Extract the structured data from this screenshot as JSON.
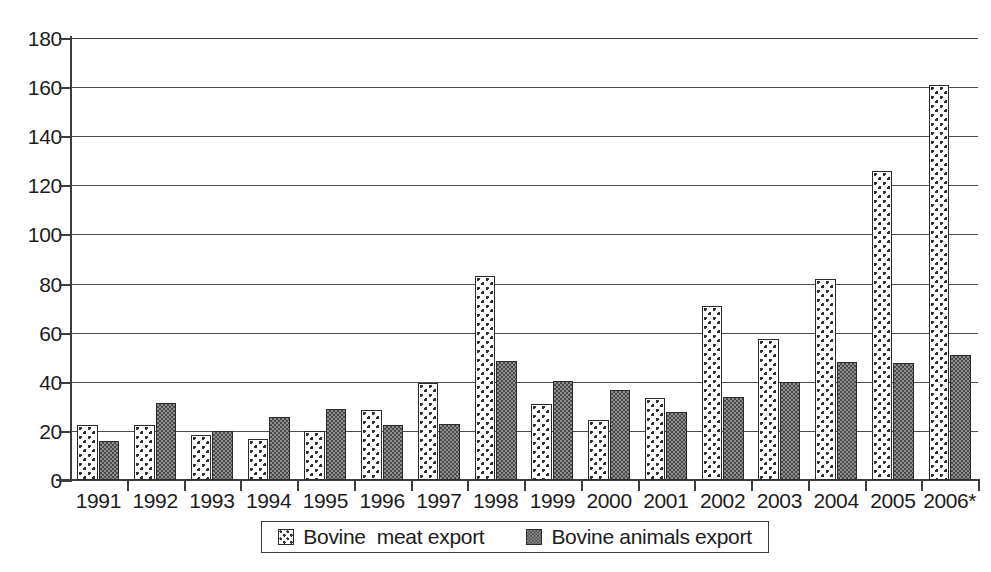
{
  "chart_data": {
    "type": "bar",
    "title": "",
    "subtitle": "",
    "xlabel": "",
    "ylabel": "",
    "categories": [
      "1991",
      "1992",
      "1993",
      "1994",
      "1995",
      "1996",
      "1997",
      "1998",
      "1999",
      "2000",
      "2001",
      "2002",
      "2003",
      "2004",
      "2005",
      "2006*"
    ],
    "series": [
      {
        "name": "Bovine  meat export",
        "values": [
          22.5,
          22.5,
          18.5,
          16.5,
          20,
          28.5,
          39.5,
          83,
          31,
          24.5,
          33.5,
          71,
          57.5,
          82,
          126,
          161
        ]
      },
      {
        "name": "Bovine animals export",
        "values": [
          16,
          31.5,
          20,
          25.5,
          29,
          22.5,
          23,
          48.5,
          40.5,
          36.5,
          27.5,
          34,
          40,
          48,
          47.5,
          51
        ]
      }
    ],
    "ylim": [
      0,
      180
    ],
    "y_ticks": [
      0,
      20,
      40,
      60,
      80,
      100,
      120,
      140,
      160,
      180
    ],
    "grid": "horizontal",
    "legend_position": "bottom",
    "colors": {
      "series1_fill": "#ffffff",
      "series1_pattern": "#2e2e2e",
      "series2_fill": "#8e8e8e",
      "series2_pattern": "#4a4a4a",
      "axis": "#3c3c3c",
      "gridline": "#4d4d4d",
      "text": "#1c1c1c"
    }
  },
  "legend": {
    "items": [
      {
        "label": "Bovine  meat export",
        "swatch": "dotted-light-swatch"
      },
      {
        "label": "Bovine animals export",
        "swatch": "checkered-dark-swatch"
      }
    ]
  }
}
